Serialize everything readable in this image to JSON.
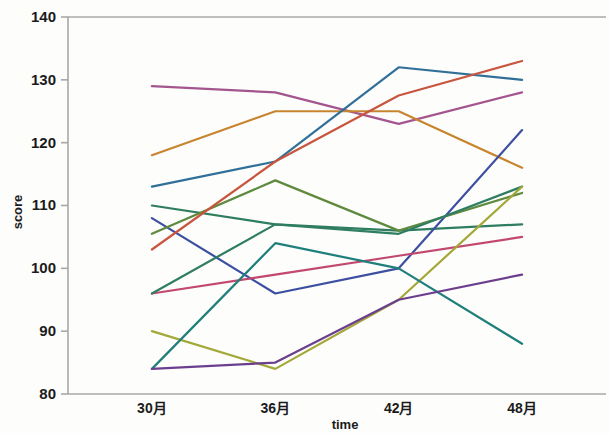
{
  "chart_data": {
    "type": "line",
    "title": "",
    "subtitle": "",
    "xlabel": "time",
    "ylabel": "score",
    "categories": [
      "30月",
      "36月",
      "42月",
      "48月"
    ],
    "x_tick_labels": [
      "30月",
      "36月",
      "42月",
      "48月"
    ],
    "y_tick_labels": [
      "80",
      "90",
      "100",
      "110",
      "120",
      "130",
      "140"
    ],
    "y_ticks": [
      80,
      90,
      100,
      110,
      120,
      130,
      140
    ],
    "ylim": [
      80,
      140
    ],
    "xlim": [
      0,
      5
    ],
    "grid": false,
    "legend": false,
    "legend_position": "none",
    "annotations": [],
    "series": [
      {
        "name": "subject-01",
        "color": "#a4558e",
        "values": [
          129,
          128,
          123,
          128
        ]
      },
      {
        "name": "subject-02",
        "color": "#c8852f",
        "values": [
          118,
          125,
          125,
          116
        ]
      },
      {
        "name": "subject-03",
        "color": "#2f6f98",
        "values": [
          113,
          117,
          132,
          130
        ]
      },
      {
        "name": "subject-04",
        "color": "#2e7d5e",
        "values": [
          110,
          107,
          106,
          107
        ]
      },
      {
        "name": "subject-05",
        "color": "#3c4fa0",
        "values": [
          108,
          96,
          100,
          122
        ]
      },
      {
        "name": "subject-06",
        "color": "#5f8a3e",
        "values": [
          105.5,
          114,
          106,
          112
        ]
      },
      {
        "name": "subject-07",
        "color": "#c8553d",
        "values": [
          103,
          117,
          127.5,
          133
        ]
      },
      {
        "name": "subject-08",
        "color": "#c2486f",
        "values": [
          96,
          99,
          102,
          105
        ]
      },
      {
        "name": "subject-09",
        "color": "#2f7d62",
        "values": [
          96,
          107,
          105.5,
          113
        ]
      },
      {
        "name": "subject-10",
        "color": "#a3a838",
        "values": [
          90,
          84,
          95,
          113
        ]
      },
      {
        "name": "subject-11",
        "color": "#1f7f7a",
        "values": [
          84,
          104,
          100,
          88
        ]
      },
      {
        "name": "subject-12",
        "color": "#6b3f8e",
        "values": [
          84,
          85,
          95,
          99
        ]
      }
    ]
  },
  "axes": {
    "y_axis_title": "score",
    "x_axis_title": "time"
  },
  "colors": {
    "axis": "#a8a8a8",
    "text": "#1b1b1b",
    "background": "#fdfdfc"
  }
}
